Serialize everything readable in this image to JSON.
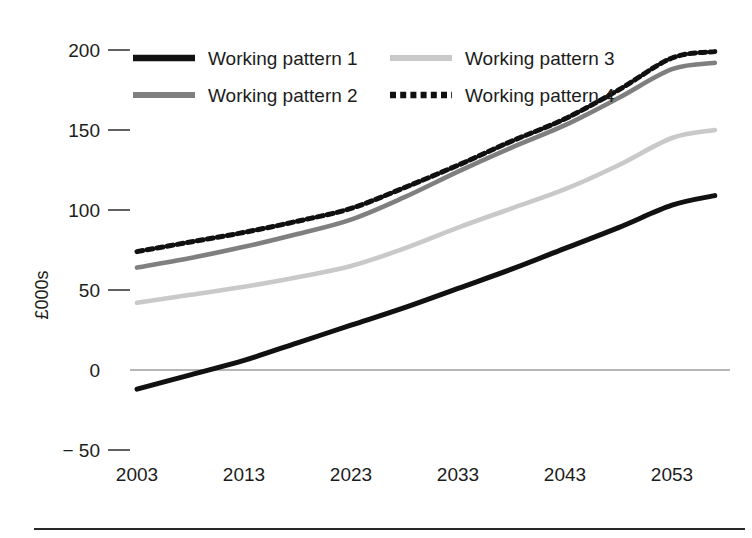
{
  "chart_data": {
    "type": "line",
    "title": "",
    "subtitle": "",
    "xlabel": "",
    "ylabel": "£000s",
    "x": [
      2003,
      2008,
      2013,
      2018,
      2023,
      2028,
      2033,
      2038,
      2043,
      2048,
      2053,
      2057
    ],
    "xlim": [
      2003,
      2057
    ],
    "ylim": [
      -50,
      200
    ],
    "xticks": [
      "2003",
      "2013",
      "2023",
      "2033",
      "2043",
      "2053"
    ],
    "xtick_values": [
      2003,
      2013,
      2023,
      2033,
      2043,
      2053
    ],
    "yticks": [
      "200",
      "150",
      "100",
      "50",
      "0",
      "− 50"
    ],
    "ytick_values": [
      200,
      150,
      100,
      50,
      0,
      -50
    ],
    "grid": false,
    "zero_line": true,
    "legend_position": "top",
    "legend_columns": 2,
    "series": [
      {
        "name": "Working pattern 1",
        "color": "#111111",
        "style": "solid",
        "width": 5.0,
        "values": [
          -12,
          -3,
          6,
          17,
          28,
          39,
          51,
          63,
          76,
          89,
          103,
          109
        ]
      },
      {
        "name": "Working pattern 2",
        "color": "#7f7f7f",
        "style": "solid",
        "width": 4.6,
        "values": [
          64,
          70,
          77,
          85,
          94,
          108,
          124,
          139,
          153,
          170,
          188,
          192
        ]
      },
      {
        "name": "Working pattern 3",
        "color": "#c9c9c9",
        "style": "solid",
        "width": 4.6,
        "values": [
          42,
          47,
          52,
          58,
          65,
          76,
          89,
          101,
          113,
          128,
          145,
          150
        ]
      },
      {
        "name": "Working pattern 4",
        "color": "#101010",
        "style": "dotted",
        "width": 5.0,
        "values": [
          74,
          80,
          86,
          93,
          101,
          114,
          128,
          143,
          157,
          175,
          195,
          199
        ]
      }
    ]
  },
  "axes": {
    "y_axis_title": "£000s",
    "y_tick_labels": [
      "200",
      "150",
      "100",
      "50",
      "0",
      "− 50"
    ],
    "x_tick_labels": [
      "2003",
      "2013",
      "2023",
      "2033",
      "2043",
      "2053"
    ]
  },
  "legend": {
    "entries": [
      {
        "label": "Working pattern 1",
        "swatch": "solid-black-line-swatch"
      },
      {
        "label": "Working pattern 2",
        "swatch": "solid-gray-line-swatch"
      },
      {
        "label": "Working pattern 3",
        "swatch": "solid-light-gray-line-swatch"
      },
      {
        "label": "Working pattern 4",
        "swatch": "dotted-black-line-swatch"
      }
    ]
  },
  "colors": {
    "pattern1": "#111111",
    "pattern2": "#7f7f7f",
    "pattern3": "#c9c9c9",
    "pattern4": "#101010",
    "background": "#ffffff",
    "axis": "#3a3a3a",
    "zero_line": "#6e6e6e"
  }
}
